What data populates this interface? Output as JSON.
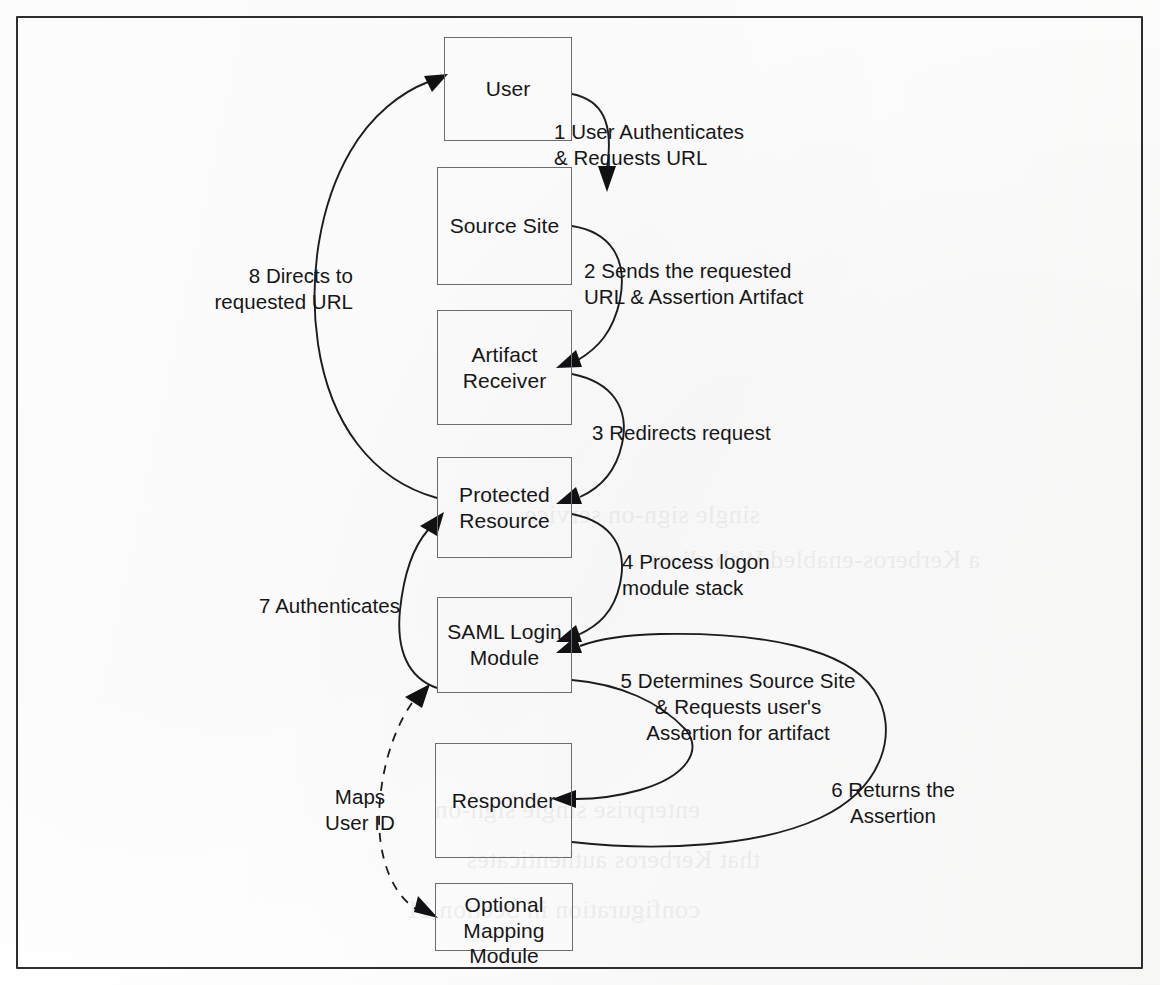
{
  "figure": {
    "kind": "flow-diagram",
    "frame": {
      "border_color": "#2e2e30"
    }
  },
  "nodes": [
    {
      "id": "user",
      "label": "User"
    },
    {
      "id": "source-site",
      "label": "Source Site"
    },
    {
      "id": "artifact-receiver",
      "label": "Artifact\nReceiver"
    },
    {
      "id": "protected-resource",
      "label": "Protected\nResource"
    },
    {
      "id": "saml-login-module",
      "label": "SAML Login\nModule"
    },
    {
      "id": "responder",
      "label": "Responder"
    },
    {
      "id": "optional-mapping-module",
      "label": "Optional\nMapping\nModule"
    }
  ],
  "edges": [
    {
      "id": "step-1",
      "number": "1",
      "label": "1 User Authenticates\n& Requests URL",
      "from": "user",
      "to": "source-site"
    },
    {
      "id": "step-2",
      "number": "2",
      "label": "2 Sends the requested\nURL & Assertion Artifact",
      "from": "source-site",
      "to": "artifact-receiver"
    },
    {
      "id": "step-3",
      "number": "3",
      "label": "3 Redirects request",
      "from": "artifact-receiver",
      "to": "protected-resource"
    },
    {
      "id": "step-4",
      "number": "4",
      "label": "4 Process logon\nmodule stack",
      "from": "protected-resource",
      "to": "saml-login-module"
    },
    {
      "id": "step-5",
      "number": "5",
      "label": "5 Determines Source Site\n& Requests user's\nAssertion for artifact",
      "from": "saml-login-module",
      "to": "responder"
    },
    {
      "id": "step-6",
      "number": "6",
      "label": "6 Returns the\nAssertion",
      "from": "responder",
      "to": "saml-login-module"
    },
    {
      "id": "step-7",
      "number": "7",
      "label": "7 Authenticates",
      "from": "saml-login-module",
      "to": "protected-resource"
    },
    {
      "id": "step-8",
      "number": "8",
      "label": "8 Directs to\nrequested URL",
      "from": "protected-resource",
      "to": "user"
    },
    {
      "id": "maps-user-id",
      "number": "",
      "label": "Maps\nUser ID",
      "from": "saml-login-module",
      "to": "optional-mapping-module",
      "style": "dashed",
      "bidirectional": true
    }
  ],
  "ghost_text": [
    {
      "text": "single sign-on service"
    },
    {
      "text": "a Kerberos-enabled Web client"
    },
    {
      "text": "enterprise single sign-on"
    },
    {
      "text": "that Kerberos authenticates"
    },
    {
      "text": "configuration in Section 11"
    }
  ]
}
